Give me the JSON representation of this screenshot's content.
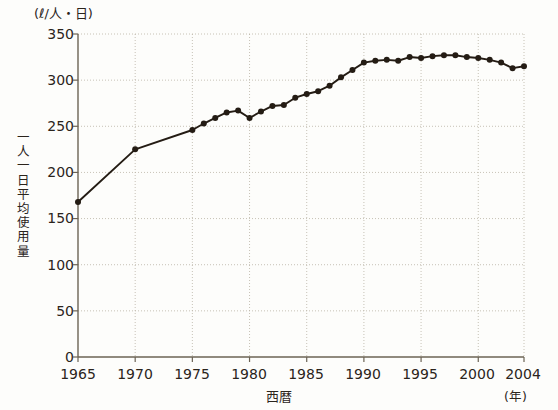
{
  "chart_data": {
    "type": "line",
    "title": "",
    "subtitle": "",
    "xlabel": "西暦",
    "xlabel_unit": "(年)",
    "ylabel": "一人一日平均使用量",
    "ylabel_unit": "(ℓ/人・日)",
    "xlim": [
      1965,
      2004
    ],
    "ylim": [
      0,
      350
    ],
    "yticks": [
      0,
      50,
      100,
      150,
      200,
      250,
      300,
      350
    ],
    "xticks": [
      1965,
      1970,
      1975,
      1980,
      1985,
      1990,
      1995,
      2000,
      2004
    ],
    "grid": true,
    "grid_style": "dotted",
    "legend": "none",
    "marker": "filled-circle",
    "line_color": "#241c14",
    "marker_color": "#241c14",
    "grid_color": "#b9b2a4",
    "axis_color": "#6b6355",
    "x": [
      1965,
      1970,
      1975,
      1976,
      1977,
      1978,
      1979,
      1980,
      1981,
      1982,
      1983,
      1984,
      1985,
      1986,
      1987,
      1988,
      1989,
      1990,
      1991,
      1992,
      1993,
      1994,
      1995,
      1996,
      1997,
      1998,
      1999,
      2000,
      2001,
      2002,
      2003,
      2004
    ],
    "values": [
      168,
      225,
      246,
      253,
      259,
      265,
      267,
      259,
      266,
      272,
      273,
      281,
      285,
      288,
      294,
      303,
      311,
      319,
      321,
      322,
      321,
      325,
      324,
      326,
      327,
      327,
      325,
      324,
      322,
      319,
      313,
      315
    ],
    "annotations": []
  },
  "axis": {
    "y_tick_labels": [
      "350",
      "300",
      "250",
      "200",
      "150",
      "100",
      "50",
      "0"
    ],
    "x_tick_labels": [
      "1965",
      "1970",
      "1975",
      "1980",
      "1985",
      "1990",
      "1995",
      "2000",
      "2004"
    ]
  },
  "labels": {
    "y_unit": "(ℓ/人・日)",
    "y_title_chars": [
      "一",
      "人",
      "一",
      "日",
      "平",
      "均",
      "使",
      "用",
      "量"
    ],
    "x_title": "西暦",
    "x_unit": "(年)"
  }
}
